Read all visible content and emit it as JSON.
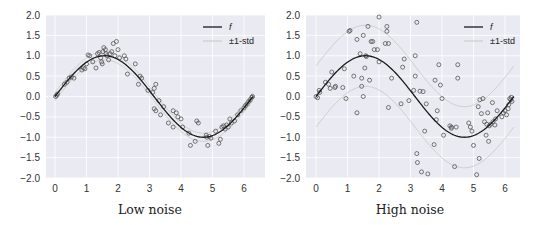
{
  "colors": {
    "plot_background": "#eaeaf2",
    "grid": "#ffffff",
    "f_line": "#1a1a1a",
    "std_line": "#cfcfcf",
    "marker_edge": "#555555"
  },
  "chart_data": [
    {
      "type": "scatter",
      "title": "",
      "caption": "Low noise",
      "xlabel": "",
      "ylabel": "",
      "xlim": [
        -0.3,
        6.6
      ],
      "ylim": [
        -2.0,
        2.0
      ],
      "xticks": [
        0,
        1,
        2,
        3,
        4,
        5,
        6
      ],
      "xtick_labels": [
        "0",
        "1",
        "2",
        "3",
        "4",
        "5",
        "6"
      ],
      "yticks": [
        2.0,
        1.5,
        1.0,
        0.5,
        0.0,
        -0.5,
        -1.0,
        -1.5,
        -2.0
      ],
      "ytick_labels": [
        "2.0",
        "1.5",
        "1.0",
        "0.5",
        "0.0",
        "−0.5",
        "−1.0",
        "−1.5",
        "−2.0"
      ],
      "grid": true,
      "legend": {
        "position": "upper right",
        "entries": [
          "f",
          "±1-std"
        ]
      },
      "std": 0.1,
      "series": [
        {
          "name": "f",
          "kind": "line",
          "function": "sin(x)",
          "x_range": [
            0,
            6.283
          ]
        },
        {
          "name": "±1-std",
          "kind": "band_lines",
          "offset": 0.1
        },
        {
          "name": "samples",
          "kind": "scatter",
          "points": [
            [
              0.02,
              0.0
            ],
            [
              0.05,
              0.03
            ],
            [
              0.08,
              0.06
            ],
            [
              0.3,
              0.3
            ],
            [
              0.38,
              0.35
            ],
            [
              0.45,
              0.45
            ],
            [
              0.52,
              0.48
            ],
            [
              0.6,
              0.45
            ],
            [
              0.85,
              0.65
            ],
            [
              0.9,
              0.7
            ],
            [
              0.95,
              0.68
            ],
            [
              1.0,
              0.8
            ],
            [
              1.05,
              1.02
            ],
            [
              1.1,
              1.0
            ],
            [
              1.2,
              0.85
            ],
            [
              1.3,
              0.7
            ],
            [
              1.35,
              1.05
            ],
            [
              1.4,
              1.08
            ],
            [
              1.45,
              0.95
            ],
            [
              1.48,
              0.85
            ],
            [
              1.5,
              0.8
            ],
            [
              1.52,
              1.1
            ],
            [
              1.55,
              1.2
            ],
            [
              1.6,
              1.15
            ],
            [
              1.62,
              1.05
            ],
            [
              1.65,
              1.0
            ],
            [
              1.7,
              0.9
            ],
            [
              1.75,
              1.05
            ],
            [
              1.8,
              1.1
            ],
            [
              1.85,
              1.3
            ],
            [
              1.9,
              1.0
            ],
            [
              1.95,
              1.35
            ],
            [
              2.0,
              1.15
            ],
            [
              2.05,
              0.95
            ],
            [
              2.2,
              1.0
            ],
            [
              2.25,
              0.92
            ],
            [
              2.3,
              0.55
            ],
            [
              2.55,
              0.8
            ],
            [
              2.65,
              0.3
            ],
            [
              2.7,
              0.5
            ],
            [
              2.75,
              0.45
            ],
            [
              2.95,
              0.15
            ],
            [
              3.1,
              0.1
            ],
            [
              3.15,
              0.2
            ],
            [
              3.2,
              0.3
            ],
            [
              3.15,
              -0.3
            ],
            [
              3.2,
              -0.35
            ],
            [
              3.3,
              -0.1
            ],
            [
              3.35,
              -0.45
            ],
            [
              3.45,
              -0.25
            ],
            [
              3.6,
              -0.65
            ],
            [
              3.75,
              -0.75
            ],
            [
              3.75,
              -0.35
            ],
            [
              3.85,
              -0.4
            ],
            [
              3.9,
              -0.5
            ],
            [
              4.0,
              -0.55
            ],
            [
              4.05,
              -0.75
            ],
            [
              4.25,
              -0.9
            ],
            [
              4.3,
              -1.2
            ],
            [
              4.45,
              -1.1
            ],
            [
              4.5,
              -0.6
            ],
            [
              4.55,
              -0.65
            ],
            [
              4.8,
              -0.95
            ],
            [
              4.82,
              -1.0
            ],
            [
              4.85,
              -1.2
            ],
            [
              4.9,
              -0.98
            ],
            [
              4.95,
              -1.02
            ],
            [
              5.1,
              -0.85
            ],
            [
              5.2,
              -1.15
            ],
            [
              5.25,
              -1.05
            ],
            [
              5.3,
              -0.75
            ],
            [
              5.35,
              -0.72
            ],
            [
              5.4,
              -0.8
            ],
            [
              5.45,
              -0.7
            ],
            [
              5.5,
              -0.75
            ],
            [
              5.55,
              -0.55
            ],
            [
              5.6,
              -0.65
            ],
            [
              5.7,
              -0.6
            ],
            [
              5.8,
              -0.45
            ],
            [
              5.9,
              -0.35
            ],
            [
              6.0,
              -0.28
            ],
            [
              6.05,
              -0.22
            ],
            [
              6.1,
              -0.18
            ],
            [
              6.15,
              -0.12
            ],
            [
              6.2,
              -0.08
            ],
            [
              6.25,
              -0.02
            ],
            [
              6.27,
              0.0
            ]
          ]
        }
      ]
    },
    {
      "type": "scatter",
      "title": "",
      "caption": "High noise",
      "xlabel": "",
      "ylabel": "",
      "xlim": [
        -0.3,
        6.6
      ],
      "ylim": [
        -2.0,
        2.0
      ],
      "xticks": [
        0,
        1,
        2,
        3,
        4,
        5,
        6
      ],
      "xtick_labels": [
        "0",
        "1",
        "2",
        "3",
        "4",
        "5",
        "6"
      ],
      "yticks": [
        2.0,
        1.5,
        1.0,
        0.5,
        0.0,
        -0.5,
        -1.0,
        -1.5,
        -2.0
      ],
      "ytick_labels": [
        "2.0",
        "1.5",
        "1.0",
        "0.5",
        "0.0",
        "−0.5",
        "−1.0",
        "−1.5",
        "−2.0"
      ],
      "grid": true,
      "legend": {
        "position": "upper right",
        "entries": [
          "f",
          "±1-std"
        ]
      },
      "std": 0.75,
      "series": [
        {
          "name": "f",
          "kind": "line",
          "function": "sin(x)",
          "x_range": [
            0,
            6.283
          ]
        },
        {
          "name": "±1-std",
          "kind": "band_lines",
          "offset": 0.75
        },
        {
          "name": "samples",
          "kind": "scatter",
          "points": [
            [
              0.0,
              0.0
            ],
            [
              0.05,
              -0.03
            ],
            [
              0.1,
              0.15
            ],
            [
              0.12,
              0.1
            ],
            [
              0.3,
              0.35
            ],
            [
              0.4,
              0.3
            ],
            [
              0.45,
              0.2
            ],
            [
              0.5,
              0.6
            ],
            [
              0.6,
              0.22
            ],
            [
              0.62,
              0.25
            ],
            [
              0.85,
              0.22
            ],
            [
              0.9,
              0.68
            ],
            [
              0.95,
              -0.05
            ],
            [
              1.05,
              1.6
            ],
            [
              1.08,
              1.62
            ],
            [
              1.2,
              0.5
            ],
            [
              1.3,
              1.4
            ],
            [
              1.3,
              -0.4
            ],
            [
              1.4,
              1.05
            ],
            [
              1.45,
              0.25
            ],
            [
              1.45,
              0.45
            ],
            [
              1.5,
              1.5
            ],
            [
              1.5,
              0.0
            ],
            [
              1.55,
              0.7
            ],
            [
              1.58,
              1.0
            ],
            [
              1.6,
              0.98
            ],
            [
              1.65,
              1.72
            ],
            [
              1.7,
              0.4
            ],
            [
              1.75,
              1.35
            ],
            [
              1.8,
              1.35
            ],
            [
              1.85,
              1.15
            ],
            [
              1.95,
              1.15
            ],
            [
              2.0,
              0.85
            ],
            [
              2.0,
              1.95
            ],
            [
              2.2,
              1.3
            ],
            [
              2.25,
              1.72
            ],
            [
              2.25,
              1.6
            ],
            [
              2.3,
              1.3
            ],
            [
              2.3,
              -0.27
            ],
            [
              2.4,
              0.45
            ],
            [
              2.7,
              -0.18
            ],
            [
              2.75,
              0.72
            ],
            [
              2.8,
              0.92
            ],
            [
              2.95,
              -0.1
            ],
            [
              3.1,
              0.15
            ],
            [
              3.15,
              1.0
            ],
            [
              3.15,
              0.5
            ],
            [
              3.2,
              1.82
            ],
            [
              3.2,
              -1.4
            ],
            [
              3.22,
              -1.62
            ],
            [
              3.3,
              0.13
            ],
            [
              3.35,
              -1.85
            ],
            [
              3.4,
              0.12
            ],
            [
              3.45,
              -0.85
            ],
            [
              3.5,
              -0.18
            ],
            [
              3.55,
              -1.9
            ],
            [
              3.75,
              -1.18
            ],
            [
              3.78,
              0.4
            ],
            [
              3.82,
              -0.57
            ],
            [
              3.85,
              -0.35
            ],
            [
              3.9,
              0.78
            ],
            [
              3.95,
              0.28
            ],
            [
              4.0,
              -0.05
            ],
            [
              4.05,
              -0.95
            ],
            [
              4.25,
              -0.72
            ],
            [
              4.3,
              -0.78
            ],
            [
              4.3,
              -0.75
            ],
            [
              4.4,
              -1.72
            ],
            [
              4.45,
              -0.75
            ],
            [
              4.5,
              0.78
            ],
            [
              4.5,
              0.45
            ],
            [
              4.85,
              -0.65
            ],
            [
              4.9,
              -0.75
            ],
            [
              4.95,
              -0.85
            ],
            [
              5.0,
              -1.2
            ],
            [
              5.1,
              -1.92
            ],
            [
              5.15,
              -0.25
            ],
            [
              5.18,
              -1.52
            ],
            [
              5.2,
              -0.08
            ],
            [
              5.25,
              -0.42
            ],
            [
              5.3,
              -0.05
            ],
            [
              5.35,
              -0.62
            ],
            [
              5.4,
              -0.95
            ],
            [
              5.42,
              -0.68
            ],
            [
              5.45,
              -0.4
            ],
            [
              5.48,
              -1.1
            ],
            [
              5.5,
              -0.72
            ],
            [
              5.55,
              -0.68
            ],
            [
              5.6,
              -0.15
            ],
            [
              5.62,
              -0.62
            ],
            [
              5.68,
              -0.7
            ],
            [
              5.7,
              -0.55
            ],
            [
              5.75,
              -0.35
            ],
            [
              5.9,
              -0.5
            ],
            [
              5.95,
              -0.4
            ],
            [
              6.0,
              -0.35
            ],
            [
              6.05,
              -0.45
            ],
            [
              6.1,
              -0.3
            ],
            [
              6.12,
              -0.2
            ],
            [
              6.15,
              -0.05
            ],
            [
              6.18,
              -0.08
            ],
            [
              6.2,
              -0.02
            ],
            [
              6.22,
              -0.12
            ]
          ]
        }
      ]
    }
  ],
  "panels": [
    {
      "caption": "Low noise",
      "legend": {
        "f_label": "f",
        "std_label": "±1-std"
      }
    },
    {
      "caption": "High noise",
      "legend": {
        "f_label": "f",
        "std_label": "±1-std"
      }
    }
  ]
}
